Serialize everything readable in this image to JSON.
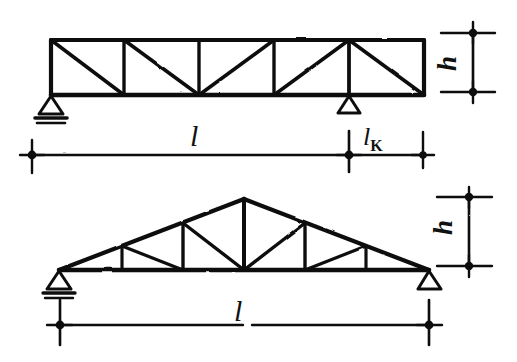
{
  "figure": {
    "ink_color": "#111111",
    "background_color": "#ffffff"
  },
  "upper_truss": {
    "name": "parallel-chord-truss",
    "type": "parallel chord Pratt truss with cantilever overhang",
    "panels": 5,
    "diagonal_pattern": "alternating descending and ascending diagonals",
    "supports": [
      {
        "kind": "pinned",
        "position": "left end"
      },
      {
        "kind": "roller",
        "position": "interior right, at end of span l"
      }
    ],
    "dimensions": {
      "height_label": "h",
      "span_label": "l",
      "cantilever_label": "l",
      "cantilever_subscript": "K"
    }
  },
  "lower_truss": {
    "name": "triangular-gable-truss",
    "type": "symmetric triangular (gable) truss",
    "supports": [
      {
        "kind": "pinned",
        "position": "left end"
      },
      {
        "kind": "roller",
        "position": "right end"
      }
    ],
    "dimensions": {
      "height_label": "h",
      "span_label": "l"
    }
  },
  "labels": {
    "upper_height": "h",
    "upper_span": "l",
    "upper_cantilever_main": "l",
    "upper_cantilever_sub": "K",
    "lower_height": "h",
    "lower_span": "l"
  }
}
